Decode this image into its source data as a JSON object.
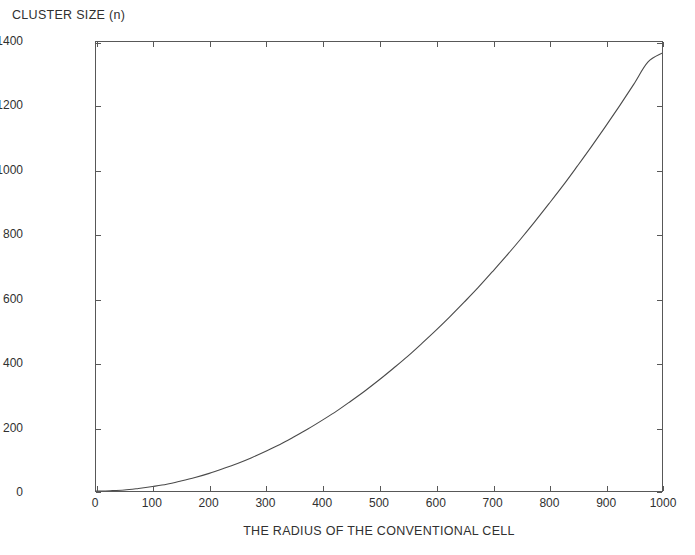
{
  "chart_data": {
    "type": "line",
    "title": "",
    "xlabel": "THE RADIUS OF THE CONVENTIONAL CELL",
    "ylabel": "CLUSTER SIZE (n)",
    "xlim": [
      0,
      1000
    ],
    "ylim": [
      0,
      1400
    ],
    "grid": false,
    "legend": null,
    "xticks": [
      0,
      100,
      200,
      300,
      400,
      500,
      600,
      700,
      800,
      900,
      1000
    ],
    "yticks": [
      0,
      200,
      400,
      600,
      800,
      1000,
      1200,
      1400
    ],
    "xticklabels": [
      "0",
      "100",
      "200",
      "300",
      "400",
      "500",
      "600",
      "700",
      "800",
      "900",
      "1000"
    ],
    "yticklabels": [
      "0",
      "200",
      "400",
      "600",
      "800",
      "1000",
      "1200",
      "1400"
    ],
    "line_color": "#4a4a4a",
    "line_width": 1,
    "series": [
      {
        "name": "cluster size",
        "x": [
          0,
          25,
          50,
          75,
          100,
          125,
          150,
          175,
          200,
          225,
          250,
          275,
          300,
          325,
          350,
          375,
          400,
          425,
          450,
          475,
          500,
          525,
          550,
          575,
          600,
          625,
          650,
          675,
          700,
          725,
          750,
          775,
          800,
          825,
          850,
          875,
          900,
          925,
          950,
          975,
          1000
        ],
        "y": [
          0,
          1,
          3,
          8,
          14,
          21,
          31,
          42,
          55,
          70,
          86,
          104,
          124,
          145,
          169,
          194,
          221,
          249,
          280,
          312,
          346,
          382,
          419,
          459,
          500,
          543,
          588,
          634,
          683,
          733,
          785,
          839,
          895,
          952,
          1012,
          1073,
          1136,
          1201,
          1268,
          1337,
          1365
        ]
      }
    ]
  },
  "axes": {
    "ylabel_text": "CLUSTER SIZE (n)",
    "xlabel_text": "THE RADIUS OF THE CONVENTIONAL CELL"
  }
}
